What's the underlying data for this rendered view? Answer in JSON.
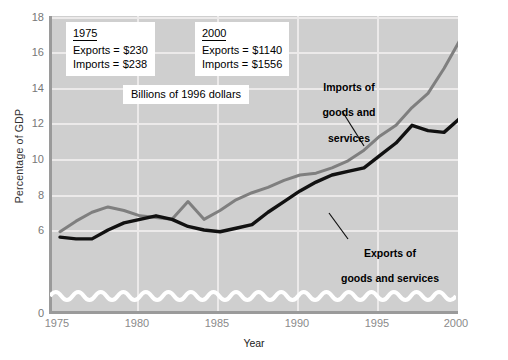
{
  "chart_data": {
    "type": "line",
    "title": "",
    "xlabel": "Year",
    "ylabel": "Percentage of GDP",
    "xlim": [
      1975,
      2000
    ],
    "ylim": [
      0,
      18
    ],
    "y_axis_break": true,
    "y_axis_break_note": "wavy break between 0 and about 5",
    "grid": true,
    "legend": "inline annotations on curves",
    "xticks": [
      "1975",
      "1980",
      "1985",
      "1990",
      "1995",
      "2000"
    ],
    "yticks": [
      "0",
      "6",
      "8",
      "10",
      "12",
      "14",
      "16",
      "18"
    ],
    "x": [
      1975,
      1976,
      1977,
      1978,
      1979,
      1980,
      1981,
      1982,
      1983,
      1984,
      1985,
      1986,
      1987,
      1988,
      1989,
      1990,
      1991,
      1992,
      1993,
      1994,
      1995,
      1996,
      1997,
      1998,
      1999,
      2000
    ],
    "series": [
      {
        "name": "Imports of goods and services",
        "color": "#7f7f7f",
        "values": [
          5.9,
          6.5,
          7.0,
          7.3,
          7.1,
          6.8,
          6.7,
          6.6,
          7.6,
          6.6,
          7.1,
          7.7,
          8.1,
          8.4,
          8.8,
          9.1,
          9.2,
          9.5,
          9.9,
          10.5,
          11.3,
          11.9,
          12.9,
          13.7,
          15.1,
          16.7
        ]
      },
      {
        "name": "Exports of goods and services",
        "color": "#111111",
        "values": [
          5.6,
          5.5,
          5.5,
          6.0,
          6.4,
          6.6,
          6.8,
          6.6,
          6.2,
          6.0,
          5.9,
          6.1,
          6.3,
          7.0,
          7.6,
          8.2,
          8.7,
          9.1,
          9.3,
          9.5,
          10.2,
          10.9,
          11.9,
          11.6,
          11.5,
          12.3
        ]
      }
    ],
    "annotations": [
      {
        "name": "imports-callout",
        "text": "Imports of\ngoods and\nservices"
      },
      {
        "name": "exports-callout",
        "text": "Exports of\ngoods and services"
      }
    ]
  },
  "notes": {
    "left": {
      "year": "1975",
      "exports_label": "Exports",
      "exports_eq": "=",
      "exports_value": "$230",
      "imports_label": "Imports",
      "imports_eq": "=",
      "imports_value": "$238"
    },
    "right": {
      "year": "2000",
      "exports_label": "Exports",
      "exports_eq": "=",
      "exports_value": "$1140",
      "imports_label": "Imports",
      "imports_eq": "=",
      "imports_value": "$1556"
    },
    "units": "Billions of 1996 dollars"
  },
  "callouts": {
    "imports_line1": "Imports of",
    "imports_line2": "goods and",
    "imports_line3": "services",
    "exports_line1": "Exports of",
    "exports_line2": "goods and services"
  },
  "axis": {
    "y_title": "Percentage of GDP",
    "x_title": "Year"
  }
}
